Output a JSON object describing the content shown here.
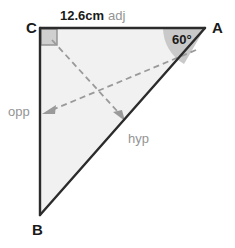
{
  "figure": {
    "type": "right-triangle-trigonometry-diagram",
    "vertices": [
      {
        "name": "C",
        "label": "C",
        "x": 40,
        "y": 28,
        "role": "right-angle-vertex"
      },
      {
        "name": "A",
        "label": "A",
        "x": 205,
        "y": 28,
        "role": "reference-angle-vertex"
      },
      {
        "name": "B",
        "label": "B",
        "x": 40,
        "y": 215,
        "role": "opposite-vertex"
      }
    ],
    "angle": {
      "at_vertex": "A",
      "label": "60°",
      "value": 60,
      "unit": "degrees"
    },
    "right_angle": {
      "at_vertex": "C",
      "marker": "square"
    },
    "sides": {
      "adjacent": {
        "measure_label": "12.6cm",
        "role_label": "adj",
        "from": "C",
        "to": "A"
      },
      "opposite": {
        "measure_label": "",
        "role_label": "opp",
        "from": "C",
        "to": "B"
      },
      "hypotenuse": {
        "measure_label": "",
        "role_label": "hyp",
        "from": "A",
        "to": "B"
      }
    },
    "pointers": [
      {
        "name": "opp-pointer",
        "label": "opp",
        "start_x": 196,
        "start_y": 50,
        "end_x": 45,
        "end_y": 113
      },
      {
        "name": "hyp-pointer",
        "label": "hyp",
        "start_x": 52,
        "start_y": 40,
        "end_x": 124,
        "end_y": 119
      }
    ],
    "colors": {
      "stroke": "#2b2b2b",
      "fill": "#f1f1f1",
      "angle_fill": "#c9c9c9",
      "right_angle_fill": "#cfcfcf",
      "right_angle_stroke": "#8f8f8f",
      "dashed": "#9a9a9a",
      "label_gray": "#949494",
      "label_dark": "#1a1a1a",
      "background": "#ffffff"
    }
  }
}
